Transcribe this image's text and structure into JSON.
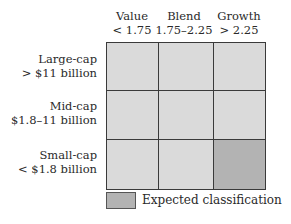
{
  "columns": [
    {
      "label": "Value",
      "range": "< 1.75"
    },
    {
      "label": "Blend",
      "range": "1.75–2.25"
    },
    {
      "label": "Growth",
      "range": "> 2.25"
    }
  ],
  "rows": [
    {
      "label": "Large-cap",
      "range": "> $11 billion"
    },
    {
      "label": "Mid-cap",
      "range": "$1.8–11 billion"
    },
    {
      "label": "Small-cap",
      "range": "< $1.8 billion"
    }
  ],
  "grid": {
    "cells": [
      [
        false,
        false,
        false
      ],
      [
        false,
        false,
        false
      ],
      [
        false,
        false,
        true
      ]
    ],
    "expected_cell": {
      "row": "Small-cap",
      "column": "Growth"
    },
    "colors": {
      "cell": "#dadada",
      "expected": "#b3b3b3",
      "border": "#3a3a3a"
    }
  },
  "legend": {
    "label": "Expected classification"
  }
}
